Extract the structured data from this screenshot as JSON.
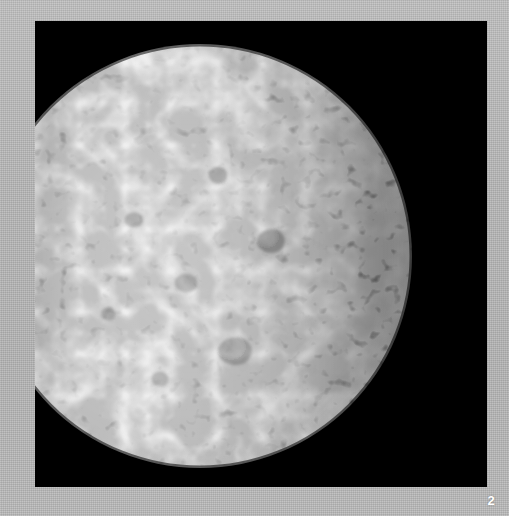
{
  "page": {
    "background_color": "#b5b5b5",
    "page_number": "2"
  },
  "photo": {
    "panel_background_color": "#000000",
    "subject_name": "moon-surface",
    "alt_text": "Heavily cratered icy moon lit from the left, right half in shadow",
    "illumination": "left-limb crescent with terminator running down the right of the disc",
    "surface_description": "densely cratered gray icy surface with overlapping impact basins",
    "highlight_color": "#e2e2e2",
    "midtone_color": "#9a9a9a",
    "shadow_color": "#1a1a1a",
    "panel": {
      "x": 35,
      "y": 21,
      "width": 452,
      "height": 466
    },
    "disc": {
      "center_x": 165,
      "center_y": 235,
      "radius": 212
    }
  }
}
